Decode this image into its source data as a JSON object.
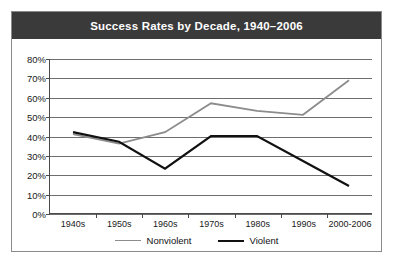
{
  "figure": {
    "title": "Success Rates by Decade, 1940–2006",
    "title_bar_color": "#3a3a3a",
    "title_text_color": "#ffffff",
    "border_color": "#8a8a8a",
    "background": "#ffffff"
  },
  "legend": {
    "position": "bottom-center",
    "entries": [
      {
        "label": "Nonviolent",
        "color": "#8c8c8c"
      },
      {
        "label": "Violent",
        "color": "#111111"
      }
    ]
  },
  "chart_data": {
    "type": "line",
    "title": "Success Rates by Decade, 1940–2006",
    "xlabel": "",
    "ylabel": "",
    "categories": [
      "1940s",
      "1950s",
      "1960s",
      "1970s",
      "1980s",
      "1990s",
      "2000-2006"
    ],
    "ylim": [
      0,
      80
    ],
    "ytick_values": [
      0,
      10,
      20,
      30,
      40,
      50,
      60,
      70,
      80
    ],
    "ytick_labels": [
      "0%",
      "10%",
      "20%",
      "30%",
      "40%",
      "50%",
      "60%",
      "70%",
      "80%"
    ],
    "grid": true,
    "grid_axis": "y",
    "series": [
      {
        "name": "Nonviolent",
        "color": "#8c8c8c",
        "values": [
          41,
          36,
          42,
          57,
          53,
          51,
          69
        ]
      },
      {
        "name": "Violent",
        "color": "#111111",
        "values": [
          42,
          37,
          23,
          40,
          40,
          27,
          14
        ]
      }
    ]
  }
}
